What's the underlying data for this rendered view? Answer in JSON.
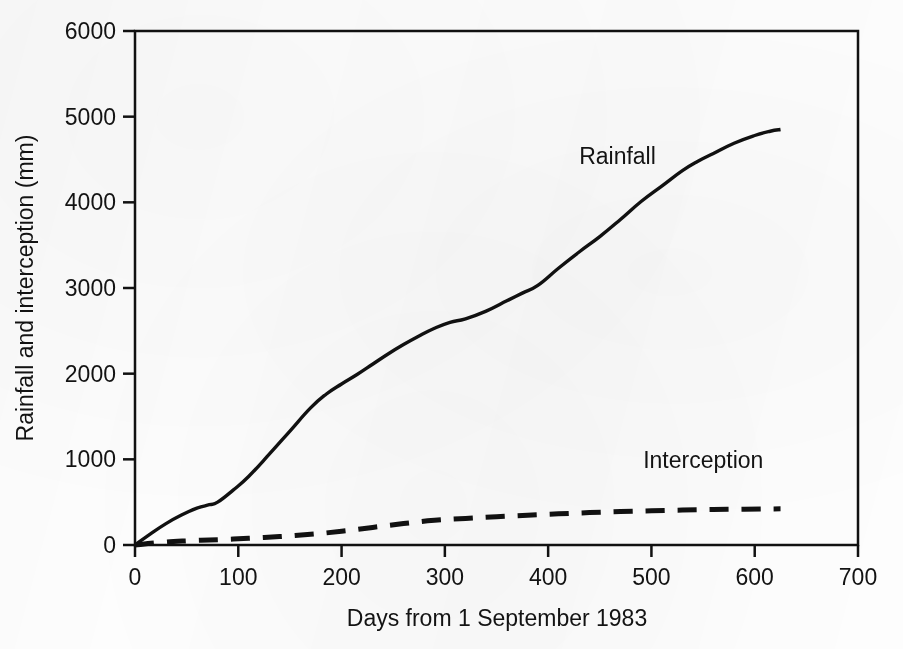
{
  "chart_data": {
    "type": "line",
    "title": "",
    "xlabel": "Days from 1 September 1983",
    "ylabel": "Rainfall and interception (mm)",
    "xlim": [
      0,
      700
    ],
    "ylim": [
      0,
      6000
    ],
    "xticks": [
      0,
      100,
      200,
      300,
      400,
      500,
      600,
      700
    ],
    "yticks": [
      0,
      1000,
      2000,
      3000,
      4000,
      5000,
      6000
    ],
    "xtick_labels": [
      "0",
      "100",
      "200",
      "300",
      "400",
      "500",
      "600",
      "700"
    ],
    "ytick_labels": [
      "0",
      "1000",
      "2000",
      "3000",
      "4000",
      "5000",
      "6000"
    ],
    "grid": false,
    "legend_position": "inline-annotation",
    "series": [
      {
        "name": "Rainfall",
        "style": "solid",
        "color": "#111111",
        "label_x": 430,
        "label_y": 4450,
        "x": [
          0,
          15,
          30,
          45,
          60,
          72,
          80,
          95,
          110,
          130,
          150,
          170,
          185,
          200,
          215,
          230,
          245,
          260,
          275,
          290,
          305,
          320,
          340,
          360,
          375,
          390,
          410,
          430,
          450,
          470,
          490,
          510,
          530,
          545,
          560,
          580,
          600,
          615,
          625
        ],
        "y": [
          0,
          130,
          250,
          350,
          430,
          470,
          500,
          640,
          800,
          1060,
          1330,
          1600,
          1760,
          1880,
          1990,
          2110,
          2230,
          2340,
          2440,
          2530,
          2600,
          2640,
          2730,
          2850,
          2940,
          3030,
          3230,
          3420,
          3600,
          3800,
          4010,
          4190,
          4370,
          4480,
          4570,
          4690,
          4780,
          4830,
          4850
        ]
      },
      {
        "name": "Interception",
        "style": "dashed",
        "color": "#111111",
        "label_x": 492,
        "label_y": 900,
        "x": [
          0,
          25,
          50,
          80,
          110,
          140,
          170,
          200,
          230,
          260,
          290,
          320,
          350,
          380,
          410,
          440,
          470,
          500,
          530,
          560,
          590,
          625
        ],
        "y": [
          0,
          30,
          48,
          62,
          78,
          98,
          125,
          160,
          205,
          250,
          288,
          310,
          330,
          348,
          364,
          378,
          390,
          400,
          408,
          414,
          418,
          422
        ]
      }
    ]
  },
  "axes": {
    "frame_color": "#111111"
  }
}
